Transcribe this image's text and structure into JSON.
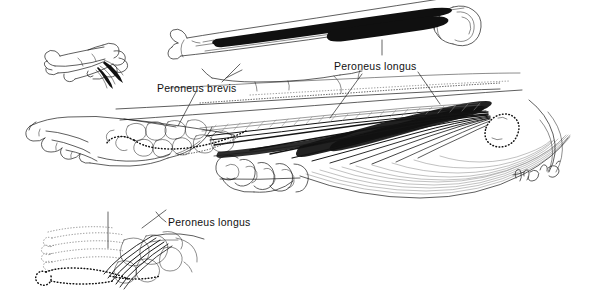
{
  "figure": {
    "background_color": "#ffffff",
    "ink_color": "#111111",
    "width": 589,
    "height": 293
  },
  "labels": {
    "peroneus_brevis": "Peroneus brevis",
    "peroneus_longus_upper": "Peroneus longus",
    "peroneus_longus_lower": "Peroneus longus"
  },
  "panels": {
    "upper_left_bones": "metatarsal and tarsal bone fragments, lateral view",
    "upper_fibula": "isolated fibula with peroneus longus origin marked in black",
    "main_leg": "lateral view of lower leg and foot with peroneus longus muscle belly",
    "lower_left_foot": "plantar view of foot showing peroneus longus tendon insertion"
  },
  "signature": {
    "artist_mark": "handwritten artist monogram"
  }
}
